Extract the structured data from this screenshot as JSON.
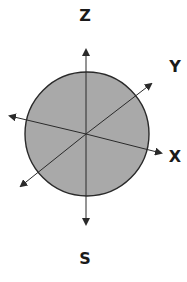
{
  "diagram": {
    "labels": {
      "z": "Z",
      "y": "Y",
      "x": "X",
      "s": "S"
    },
    "colors": {
      "sphere_fill": "#a9a9a9",
      "sphere_stroke": "#2a2a2a",
      "axis": "#2a2a2a",
      "background": "#ffffff"
    }
  }
}
